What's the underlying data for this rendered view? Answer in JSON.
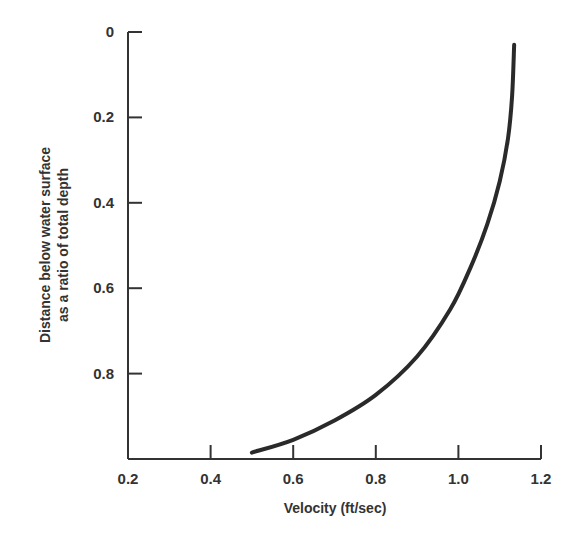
{
  "chart_data": {
    "type": "line",
    "title": "",
    "xlabel": "Velocity (ft/sec)",
    "ylabel_line1": "Distance below water surface",
    "ylabel_line2": "as a ratio of total depth",
    "xlim": [
      0.2,
      1.2
    ],
    "ylim": [
      1.0,
      0
    ],
    "y_inverted": true,
    "grid": false,
    "x_ticks": [
      "0.2",
      "0.4",
      "0.6",
      "0.8",
      "1.0",
      "1.2"
    ],
    "y_ticks": [
      "0",
      "0.2",
      "0.4",
      "0.6",
      "0.8"
    ],
    "series": [
      {
        "name": "Velocity profile",
        "x": [
          1.135,
          1.13,
          1.12,
          1.1,
          1.07,
          1.03,
          0.98,
          0.9,
          0.8,
          0.7,
          0.6,
          0.5
        ],
        "y": [
          0.03,
          0.15,
          0.25,
          0.35,
          0.45,
          0.55,
          0.65,
          0.76,
          0.85,
          0.91,
          0.955,
          0.985
        ]
      }
    ],
    "legend": "none"
  }
}
